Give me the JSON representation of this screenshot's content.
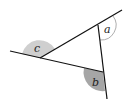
{
  "diagram": {
    "type": "triangle-exterior-angles",
    "labels": {
      "a": "a",
      "b": "b",
      "c": "c"
    },
    "colors": {
      "line": "#111111",
      "angle_a_fill": "#ffffff",
      "angle_a_stroke": "#999999",
      "angle_b_fill": "#a6a6a6",
      "angle_c_fill": "#cfcfcf"
    }
  }
}
